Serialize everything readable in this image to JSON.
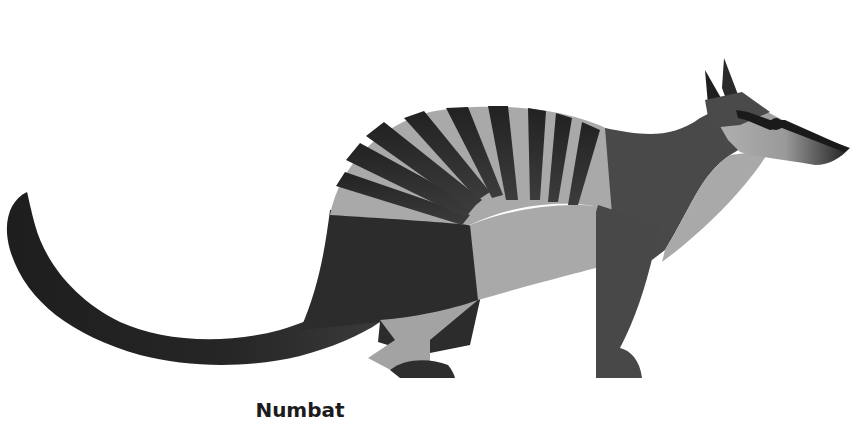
{
  "illustration": {
    "subject": "numbat",
    "style": "flat geometric grayscale",
    "colors": {
      "background": "#ffffff",
      "dark": "#2a2a2a",
      "mid": "#4a4a4a",
      "light": "#a8a8a8",
      "nose": "#1e1e1e"
    }
  },
  "caption": {
    "text": "Numbat"
  }
}
